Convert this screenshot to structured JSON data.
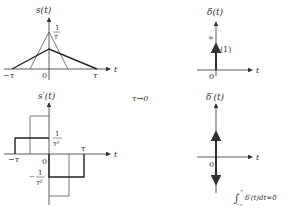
{
  "panels": {
    "s": {
      "ylabel": "s(t)",
      "xlabel": "t",
      "peak_label_num": "1",
      "peak_label_den": "τ",
      "tick_neg": "−τ",
      "tick_pos": "τ",
      "origin": "0"
    },
    "s_prime": {
      "ylabel": "s′(t)",
      "xlabel": "t",
      "pos_label_num": "1",
      "pos_label_den": "τ²",
      "neg_label_sign": "−",
      "neg_label_num": "1",
      "neg_label_den": "τ²",
      "tick_neg": "−τ",
      "tick_pos": "τ",
      "origin": "0"
    },
    "delta": {
      "ylabel": "δ(t)",
      "xlabel": "t",
      "infinity": "∞",
      "weight": "(1)",
      "origin": "0"
    },
    "delta_prime": {
      "ylabel": "δ′(t)",
      "xlabel": "t",
      "origin": "0",
      "integral": "δ′(t)dt=0",
      "int_upper": "∞",
      "int_lower": "−∞"
    }
  },
  "limit_label": "τ→0",
  "colors": {
    "line": "#333333",
    "thin": "#555555"
  }
}
